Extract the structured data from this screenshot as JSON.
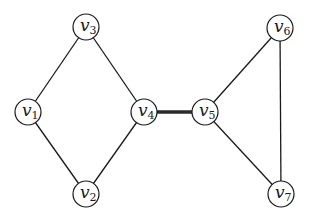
{
  "diagram": {
    "type": "undirected-graph",
    "node_radius": 13,
    "nodes": [
      {
        "id": "v1",
        "base": "v",
        "sub": "1",
        "x": 28,
        "y": 112
      },
      {
        "id": "v2",
        "base": "v",
        "sub": "2",
        "x": 86,
        "y": 194
      },
      {
        "id": "v3",
        "base": "v",
        "sub": "3",
        "x": 86,
        "y": 27
      },
      {
        "id": "v4",
        "base": "v",
        "sub": "4",
        "x": 144,
        "y": 112
      },
      {
        "id": "v5",
        "base": "v",
        "sub": "5",
        "x": 205,
        "y": 112
      },
      {
        "id": "v6",
        "base": "v",
        "sub": "6",
        "x": 280,
        "y": 28
      },
      {
        "id": "v7",
        "base": "v",
        "sub": "7",
        "x": 281,
        "y": 194
      }
    ],
    "edges": [
      {
        "from": "v1",
        "to": "v3",
        "style": "normal"
      },
      {
        "from": "v3",
        "to": "v4",
        "style": "normal"
      },
      {
        "from": "v1",
        "to": "v2",
        "style": "normal"
      },
      {
        "from": "v2",
        "to": "v4",
        "style": "normal"
      },
      {
        "from": "v4",
        "to": "v5",
        "style": "bridge"
      },
      {
        "from": "v5",
        "to": "v6",
        "style": "normal"
      },
      {
        "from": "v5",
        "to": "v7",
        "style": "normal"
      },
      {
        "from": "v6",
        "to": "v7",
        "style": "normal"
      }
    ]
  }
}
